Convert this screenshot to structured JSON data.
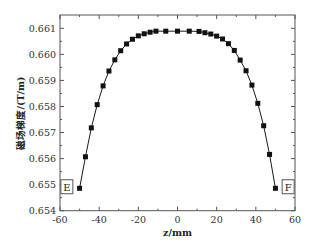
{
  "chart_data": {
    "type": "line",
    "title": "",
    "xlabel": "z/mm",
    "ylabel": "磁场梯度/(T/m)",
    "xlim": [
      -60,
      60
    ],
    "ylim": [
      0.654,
      0.6612
    ],
    "xticks": [
      -60,
      -40,
      -20,
      0,
      20,
      40,
      60
    ],
    "xtick_labels": [
      "-60",
      "-40",
      "-20",
      "0",
      "20",
      "40",
      "60"
    ],
    "yticks": [
      0.654,
      0.655,
      0.656,
      0.657,
      0.658,
      0.659,
      0.66,
      0.661
    ],
    "ytick_labels": [
      "0.654",
      "0.655",
      "0.656",
      "0.657",
      "0.658",
      "0.659",
      "0.660",
      "0.661"
    ],
    "grid": false,
    "legend": "none",
    "marker": "square",
    "line_color": "#1a1a1a",
    "marker_color": "#111111",
    "series": [
      {
        "name": "gradient",
        "x": [
          -50,
          -47,
          -44,
          -41,
          -38,
          -35,
          -32,
          -29,
          -26,
          -23,
          -20,
          -17,
          -14,
          -11,
          -6,
          0,
          6,
          11,
          14,
          17,
          20,
          23,
          26,
          29,
          32,
          35,
          38,
          41,
          44,
          47,
          50
        ],
        "y": [
          0.65486,
          0.65607,
          0.65718,
          0.65807,
          0.65879,
          0.65936,
          0.65979,
          0.66014,
          0.6604,
          0.66058,
          0.66071,
          0.66079,
          0.66085,
          0.66089,
          0.66089,
          0.66089,
          0.66089,
          0.66088,
          0.66083,
          0.66078,
          0.6607,
          0.66059,
          0.66041,
          0.66015,
          0.65978,
          0.65937,
          0.65882,
          0.65812,
          0.65726,
          0.65616,
          0.65486
        ]
      }
    ],
    "annotations": [
      {
        "text": "E",
        "x": -56.5,
        "y": 0.6549
      },
      {
        "text": "F",
        "x": 56.5,
        "y": 0.6549
      }
    ]
  }
}
